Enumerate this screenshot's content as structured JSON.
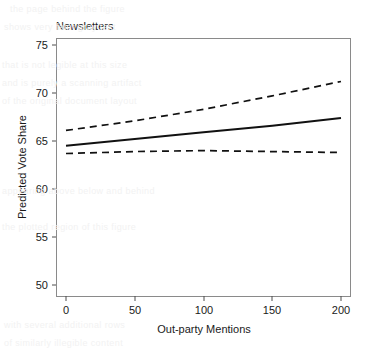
{
  "chart_data": {
    "type": "line",
    "title": "Newsletters",
    "xlabel": "Out-party Mentions",
    "ylabel": "Predicted Vote Share",
    "xlim": [
      0,
      200
    ],
    "ylim": [
      48.5,
      76.5
    ],
    "xticks": [
      0,
      50,
      100,
      150,
      200
    ],
    "xtick_labels": [
      "0",
      "50",
      "100",
      "150",
      "200"
    ],
    "yticks": [
      50,
      55,
      60,
      65,
      70,
      75
    ],
    "ytick_labels": [
      "50",
      "55",
      "60",
      "65",
      "70",
      "75"
    ],
    "grid": false,
    "legend": "none",
    "line_color": "#111111",
    "series": [
      {
        "name": "Predicted vote share",
        "style": "solid",
        "x": [
          0,
          50,
          100,
          150,
          200
        ],
        "values": [
          64.5,
          65.2,
          65.9,
          66.6,
          67.4
        ]
      },
      {
        "name": "Upper 95% confidence bound",
        "style": "dashed",
        "x": [
          0,
          50,
          100,
          150,
          200
        ],
        "values": [
          66.1,
          67.1,
          68.3,
          69.7,
          71.2
        ]
      },
      {
        "name": "Lower 95% confidence bound",
        "style": "dashed",
        "x": [
          0,
          50,
          100,
          150,
          200
        ],
        "values": [
          63.7,
          63.9,
          64.0,
          63.9,
          63.8
        ]
      }
    ]
  },
  "background": {
    "note": "faint ghost text bleeding through from underlying document page",
    "lines": [
      "the page behind the figure",
      "shows very faint gray text",
      "that is not legible at this size",
      "and is purely a scanning artifact",
      "of the original document layout",
      "appearing above below and behind",
      "the plotted region of this figure",
      "with several additional rows",
      "of similarly illegible content"
    ]
  }
}
